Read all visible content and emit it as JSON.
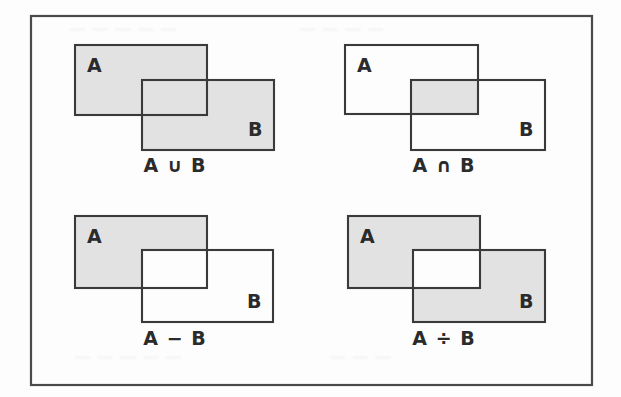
{
  "figure": {
    "frame": {
      "x": 31,
      "y": 16,
      "width": 561,
      "height": 369
    },
    "colors": {
      "shade": "#e2e2e2",
      "outline": "#3a3a3a",
      "frame": "#4a4a4a",
      "label": "#2b2b2b",
      "page": "#fdfdfd"
    },
    "ghost_artifacts": [
      "— — — — —",
      "— — — —",
      "— — — — —",
      "— — —"
    ],
    "panels": [
      {
        "id": "union",
        "caption": "A ∪ B",
        "operation": "union",
        "caption_x": 175,
        "caption_y": 172,
        "rect_a": {
          "x": 75,
          "y": 45,
          "width": 132,
          "height": 70
        },
        "rect_b": {
          "x": 142,
          "y": 80,
          "width": 132,
          "height": 70
        },
        "label_a": {
          "text": "A",
          "x": 87,
          "y": 72
        },
        "label_b": {
          "text": "B",
          "x": 248,
          "y": 136
        },
        "shaded": [
          "a_only",
          "overlap",
          "b_only"
        ]
      },
      {
        "id": "intersection",
        "caption": "A ∩ B",
        "operation": "intersection",
        "caption_x": 444,
        "caption_y": 172,
        "rect_a": {
          "x": 345,
          "y": 45,
          "width": 133,
          "height": 69
        },
        "rect_b": {
          "x": 411,
          "y": 80,
          "width": 134,
          "height": 70
        },
        "label_a": {
          "text": "A",
          "x": 357,
          "y": 72
        },
        "label_b": {
          "text": "B",
          "x": 519,
          "y": 136
        },
        "shaded": [
          "overlap"
        ]
      },
      {
        "id": "difference",
        "caption": "A − B",
        "operation": "difference",
        "caption_x": 175,
        "caption_y": 345,
        "rect_a": {
          "x": 75,
          "y": 216,
          "width": 132,
          "height": 72
        },
        "rect_b": {
          "x": 142,
          "y": 250,
          "width": 131,
          "height": 72
        },
        "label_a": {
          "text": "A",
          "x": 87,
          "y": 243
        },
        "label_b": {
          "text": "B",
          "x": 247,
          "y": 308
        },
        "shaded": [
          "a_only"
        ]
      },
      {
        "id": "symmetric-difference",
        "caption": "A ÷ B",
        "operation": "symmetric_difference",
        "caption_x": 444,
        "caption_y": 345,
        "rect_a": {
          "x": 348,
          "y": 216,
          "width": 132,
          "height": 72
        },
        "rect_b": {
          "x": 413,
          "y": 250,
          "width": 132,
          "height": 72
        },
        "label_a": {
          "text": "A",
          "x": 360,
          "y": 243
        },
        "label_b": {
          "text": "B",
          "x": 519,
          "y": 308
        },
        "shaded": [
          "a_only",
          "b_only"
        ]
      }
    ]
  }
}
